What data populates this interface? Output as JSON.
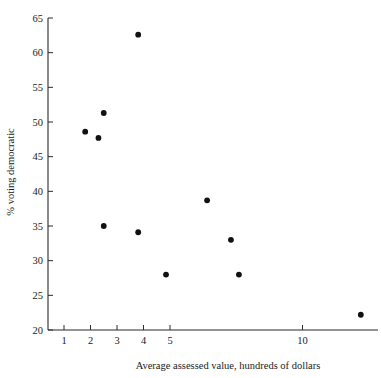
{
  "chart_data": {
    "type": "scatter",
    "title": "",
    "xlabel": "Average assessed value, hundreds of dollars",
    "ylabel": "% voting democratic",
    "xlim": [
      0.35,
      12.8
    ],
    "ylim": [
      20,
      65
    ],
    "grid": false,
    "legend": "none",
    "xticks": [
      1,
      2,
      3,
      4,
      5,
      10
    ],
    "xticklabels": [
      "1",
      "2",
      "3",
      "4",
      "5",
      "10"
    ],
    "yticks": [
      20,
      25,
      30,
      35,
      40,
      45,
      50,
      55,
      60,
      65
    ],
    "yticklabels": [
      "20",
      "25",
      "30",
      "35",
      "40",
      "45",
      "50",
      "55",
      "60",
      "65"
    ],
    "series": [
      {
        "name": "precincts",
        "marker": "filled-circle",
        "color": "#111111",
        "points": [
          {
            "x": 1.8,
            "y": 48.6
          },
          {
            "x": 2.3,
            "y": 47.7
          },
          {
            "x": 2.5,
            "y": 51.3
          },
          {
            "x": 2.5,
            "y": 35.0
          },
          {
            "x": 3.8,
            "y": 62.6
          },
          {
            "x": 3.8,
            "y": 34.1
          },
          {
            "x": 4.85,
            "y": 28.0
          },
          {
            "x": 6.4,
            "y": 38.7
          },
          {
            "x": 7.3,
            "y": 33.0
          },
          {
            "x": 7.6,
            "y": 28.0
          },
          {
            "x": 12.2,
            "y": 22.2
          }
        ]
      }
    ]
  }
}
